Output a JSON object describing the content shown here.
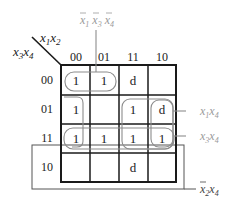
{
  "diagram": {
    "type": "karnaugh-map",
    "corner": {
      "col_vars": "x1x2",
      "row_vars": "x3x4"
    },
    "col_headers": [
      "00",
      "01",
      "11",
      "10"
    ],
    "row_headers": [
      "00",
      "01",
      "11",
      "10"
    ],
    "cells": [
      [
        "1",
        "1",
        "d",
        ""
      ],
      [
        "1",
        "",
        "1",
        "d"
      ],
      [
        "1",
        "1",
        "1",
        "1"
      ],
      [
        "",
        "",
        "d",
        ""
      ]
    ],
    "groups": [
      {
        "name": "x̄1x̄3x̄4",
        "label_parts": [
          [
            "x",
            "1",
            true
          ],
          [
            "x",
            "3",
            true
          ],
          [
            "x",
            "4",
            true
          ]
        ]
      },
      {
        "name": "x1x4",
        "label_parts": [
          [
            "x",
            "1",
            false
          ],
          [
            "x",
            "4",
            false
          ]
        ]
      },
      {
        "name": "x3x4",
        "label_parts": [
          [
            "x",
            "3",
            false
          ],
          [
            "x",
            "4",
            false
          ]
        ]
      },
      {
        "name": "x̄2x4",
        "label_parts": [
          [
            "x",
            "2",
            true
          ],
          [
            "x",
            "4",
            false
          ]
        ]
      }
    ],
    "colors": {
      "grid": "#1a1a1a",
      "group_line": "#8c8c8c",
      "group_label": "#9a9a9a",
      "text": "#222222"
    }
  }
}
